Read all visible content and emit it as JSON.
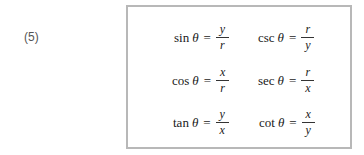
{
  "equation_number": "(5)",
  "formulas": [
    {
      "fn": "sin",
      "var": "θ",
      "eq": "=",
      "num": "y",
      "den": "r"
    },
    {
      "fn": "csc",
      "var": "θ",
      "eq": "=",
      "num": "r",
      "den": "y"
    },
    {
      "fn": "cos",
      "var": "θ",
      "eq": "=",
      "num": "x",
      "den": "r"
    },
    {
      "fn": "sec",
      "var": "θ",
      "eq": "=",
      "num": "r",
      "den": "x"
    },
    {
      "fn": "tan",
      "var": "θ",
      "eq": "=",
      "num": "y",
      "den": "x"
    },
    {
      "fn": "cot",
      "var": "θ",
      "eq": "=",
      "num": "x",
      "den": "y"
    }
  ]
}
